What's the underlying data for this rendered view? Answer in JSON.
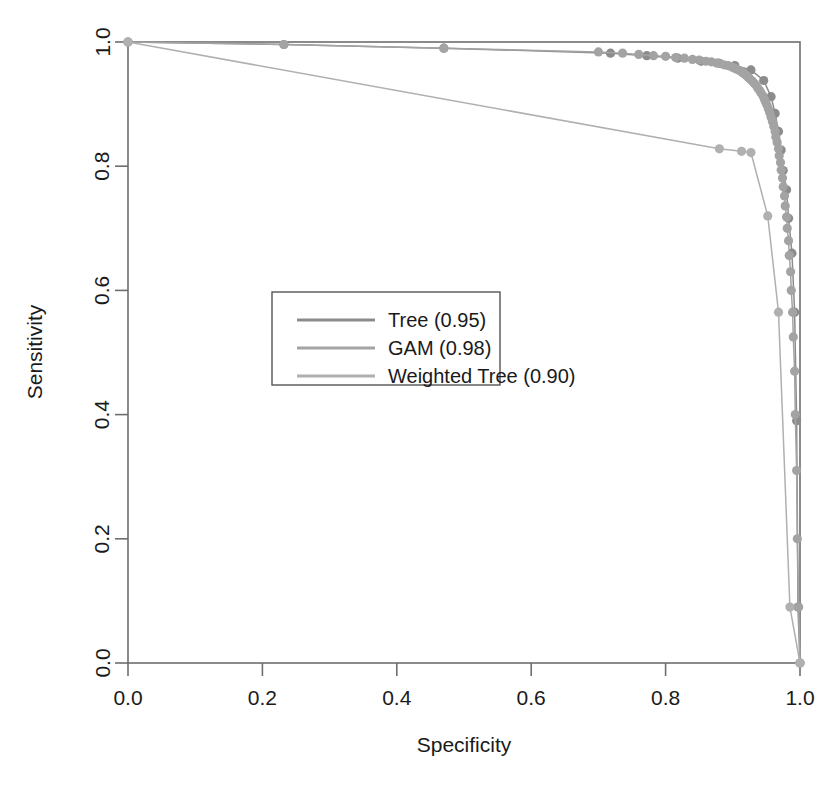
{
  "chart_data": {
    "type": "line",
    "title": "",
    "xlabel": "Specificity",
    "ylabel": "Sensitivity",
    "xlim": [
      1.0,
      0.0
    ],
    "ylim": [
      0.0,
      1.0
    ],
    "x_ticks": [
      "0.0",
      "0.2",
      "0.4",
      "0.6",
      "0.8",
      "1.0"
    ],
    "x_tick_values": [
      0.0,
      0.2,
      0.4,
      0.6,
      0.8,
      1.0
    ],
    "y_ticks": [
      "0.0",
      "0.2",
      "0.4",
      "0.6",
      "0.8",
      "1.0"
    ],
    "y_tick_values": [
      0.0,
      0.2,
      0.4,
      0.6,
      0.8,
      1.0
    ],
    "grid": false,
    "axis_reversed_x": true,
    "legend_position": "center-left",
    "marker": "filled-circle",
    "series": [
      {
        "name": "Tree (0.95)",
        "label": "Tree (0.95)",
        "auc": 0.95,
        "color": "#8c8c8c",
        "points": [
          [
            0.0,
            1.0
          ],
          [
            0.232,
            0.996
          ],
          [
            0.47,
            0.99
          ],
          [
            0.718,
            0.982
          ],
          [
            0.772,
            0.978
          ],
          [
            0.818,
            0.974
          ],
          [
            0.853,
            0.969
          ],
          [
            0.879,
            0.966
          ],
          [
            0.903,
            0.962
          ],
          [
            0.927,
            0.955
          ],
          [
            0.946,
            0.938
          ],
          [
            0.957,
            0.912
          ],
          [
            0.963,
            0.885
          ],
          [
            0.968,
            0.856
          ],
          [
            0.972,
            0.826
          ],
          [
            0.975,
            0.793
          ],
          [
            0.98,
            0.762
          ],
          [
            0.983,
            0.716
          ],
          [
            0.988,
            0.66
          ],
          [
            0.992,
            0.565
          ],
          [
            0.995,
            0.39
          ],
          [
            0.997,
            0.09
          ],
          [
            1.0,
            0.0
          ]
        ]
      },
      {
        "name": "GAM (0.98)",
        "label": "GAM (0.98)",
        "auc": 0.98,
        "color": "#a3a3a3",
        "points": [
          [
            0.0,
            1.0
          ],
          [
            0.232,
            0.996
          ],
          [
            0.47,
            0.99
          ],
          [
            0.7,
            0.984
          ],
          [
            0.736,
            0.982
          ],
          [
            0.76,
            0.98
          ],
          [
            0.782,
            0.978
          ],
          [
            0.8,
            0.977
          ],
          [
            0.815,
            0.975
          ],
          [
            0.828,
            0.974
          ],
          [
            0.84,
            0.972
          ],
          [
            0.85,
            0.971
          ],
          [
            0.86,
            0.969
          ],
          [
            0.868,
            0.968
          ],
          [
            0.876,
            0.966
          ],
          [
            0.882,
            0.965
          ],
          [
            0.888,
            0.963
          ],
          [
            0.893,
            0.962
          ],
          [
            0.898,
            0.96
          ],
          [
            0.902,
            0.958
          ],
          [
            0.906,
            0.956
          ],
          [
            0.91,
            0.954
          ],
          [
            0.914,
            0.951
          ],
          [
            0.917,
            0.949
          ],
          [
            0.92,
            0.946
          ],
          [
            0.923,
            0.943
          ],
          [
            0.926,
            0.94
          ],
          [
            0.929,
            0.937
          ],
          [
            0.932,
            0.933
          ],
          [
            0.935,
            0.93
          ],
          [
            0.937,
            0.926
          ],
          [
            0.94,
            0.922
          ],
          [
            0.942,
            0.918
          ],
          [
            0.945,
            0.913
          ],
          [
            0.947,
            0.908
          ],
          [
            0.949,
            0.903
          ],
          [
            0.951,
            0.898
          ],
          [
            0.953,
            0.892
          ],
          [
            0.955,
            0.886
          ],
          [
            0.957,
            0.879
          ],
          [
            0.959,
            0.872
          ],
          [
            0.961,
            0.864
          ],
          [
            0.963,
            0.856
          ],
          [
            0.964,
            0.847
          ],
          [
            0.966,
            0.838
          ],
          [
            0.968,
            0.828
          ],
          [
            0.969,
            0.817
          ],
          [
            0.971,
            0.806
          ],
          [
            0.972,
            0.794
          ],
          [
            0.974,
            0.781
          ],
          [
            0.975,
            0.767
          ],
          [
            0.977,
            0.752
          ],
          [
            0.978,
            0.736
          ],
          [
            0.98,
            0.718
          ],
          [
            0.981,
            0.7
          ],
          [
            0.983,
            0.68
          ],
          [
            0.984,
            0.656
          ],
          [
            0.986,
            0.63
          ],
          [
            0.987,
            0.6
          ],
          [
            0.989,
            0.565
          ],
          [
            0.99,
            0.525
          ],
          [
            0.992,
            0.47
          ],
          [
            0.993,
            0.4
          ],
          [
            0.995,
            0.31
          ],
          [
            0.996,
            0.2
          ],
          [
            0.998,
            0.09
          ],
          [
            1.0,
            0.0
          ]
        ]
      },
      {
        "name": "Weighted Tree (0.90)",
        "label": "Weighted Tree (0.90)",
        "auc": 0.9,
        "color": "#b0b0b0",
        "points": [
          [
            0.0,
            1.0
          ],
          [
            0.88,
            0.828
          ],
          [
            0.913,
            0.824
          ],
          [
            0.927,
            0.822
          ],
          [
            0.952,
            0.72
          ],
          [
            0.968,
            0.565
          ],
          [
            0.985,
            0.09
          ],
          [
            1.0,
            0.0
          ]
        ]
      }
    ]
  },
  "legend": {
    "entries": [
      {
        "label": "Tree (0.95)"
      },
      {
        "label": "GAM (0.98)"
      },
      {
        "label": "Weighted Tree (0.90)"
      }
    ]
  },
  "axes": {
    "x_title": "Specificity",
    "y_title": "Sensitivity"
  },
  "colors": {
    "curve_tree": "#8c8c8c",
    "curve_gam": "#a3a3a3",
    "curve_weighted": "#b0b0b0",
    "frame": "#6e6e6e",
    "text": "#1a1a1a",
    "background": "#ffffff"
  }
}
